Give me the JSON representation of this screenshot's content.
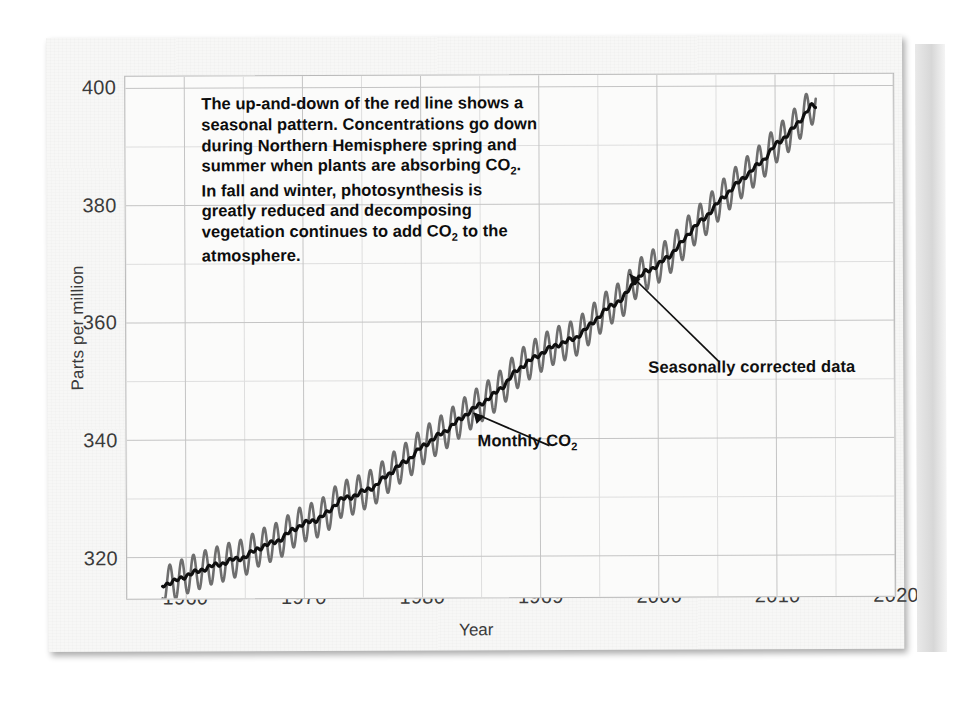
{
  "chart_data": {
    "type": "line",
    "title": "",
    "xlabel": "Year",
    "ylabel": "Parts per million",
    "xlim": [
      1955,
      2020
    ],
    "ylim": [
      313,
      402
    ],
    "xticks": [
      "1960",
      "1970",
      "1980",
      "1969",
      "2000",
      "2010",
      "2020"
    ],
    "xtick_values": [
      1960,
      1970,
      1980,
      1990,
      2000,
      2010,
      2020
    ],
    "yticks": [
      "320",
      "340",
      "360",
      "380",
      "400"
    ],
    "ytick_values": [
      320,
      340,
      360,
      380,
      400
    ],
    "grid": true,
    "grid_major_x_step": 10,
    "grid_minor_x_step": 5,
    "grid_major_y_step": 20,
    "grid_minor_y_step": 10,
    "legend": "none",
    "series": [
      {
        "name": "Monthly CO2",
        "color": "#6e6e6e",
        "description": "Monthly mean atmospheric CO2 with seasonal oscillation, amplitude about 3 ppm peak-to-trough-half",
        "seasonal_amplitude_ppm": 3.1,
        "x": [
          1958,
          1959,
          1960,
          1961,
          1962,
          1963,
          1964,
          1965,
          1966,
          1967,
          1968,
          1969,
          1970,
          1971,
          1972,
          1973,
          1974,
          1975,
          1976,
          1977,
          1978,
          1979,
          1980,
          1981,
          1982,
          1983,
          1984,
          1985,
          1986,
          1987,
          1988,
          1989,
          1990,
          1991,
          1992,
          1993,
          1994,
          1995,
          1996,
          1997,
          1998,
          1999,
          2000,
          2001,
          2002,
          2003,
          2004,
          2005,
          2006,
          2007,
          2008,
          2009,
          2010,
          2011,
          2012,
          2013
        ],
        "annual_mean": [
          315.3,
          315.9,
          316.9,
          317.6,
          318.4,
          318.9,
          319.6,
          320.0,
          321.4,
          322.2,
          323.0,
          324.6,
          325.7,
          326.3,
          327.5,
          329.7,
          330.2,
          331.1,
          332.0,
          333.8,
          335.4,
          336.8,
          338.7,
          340.1,
          341.4,
          343.0,
          344.6,
          346.0,
          347.4,
          349.2,
          351.6,
          353.1,
          354.4,
          355.6,
          356.4,
          357.1,
          358.8,
          360.8,
          362.6,
          363.7,
          366.7,
          368.4,
          369.5,
          371.1,
          373.2,
          375.8,
          377.5,
          379.8,
          381.9,
          383.8,
          385.6,
          387.4,
          389.9,
          391.6,
          393.8,
          396.5
        ]
      },
      {
        "name": "Seasonally corrected data",
        "color": "#0f0f0f",
        "description": "Seasonally adjusted trend line through the monthly data"
      }
    ]
  },
  "axis": {
    "y_title": "Parts per million",
    "x_title": "Year"
  },
  "annotation": {
    "text_line_1": "The up-and-down of the red line shows a",
    "text_line_2": "seasonal pattern. Concentrations go down",
    "text_line_3": "during Northern Hemisphere spring and",
    "text_line_4_a": "summer when plants are absorbing CO",
    "text_line_4_sub": "2",
    "text_line_4_b": ".",
    "text_line_5": "In fall and winter, photosynthesis is",
    "text_line_6": "greatly reduced and decomposing",
    "text_line_7_a": "vegetation continues to add CO",
    "text_line_7_sub": "2",
    "text_line_7_b": " to the",
    "text_line_8": "atmosphere."
  },
  "callouts": {
    "seasonally_corrected": "Seasonally corrected data",
    "monthly_a": "Monthly CO",
    "monthly_sub": "2"
  },
  "colors": {
    "monthly_series": "#6e6e6e",
    "trend_series": "#0f0f0f",
    "grid_major": "#c4c4c4",
    "grid_minor": "#dedede",
    "plot_background": "#fbfbfa",
    "page_background": "#f7f7f6",
    "text": "#3b3b3b"
  }
}
